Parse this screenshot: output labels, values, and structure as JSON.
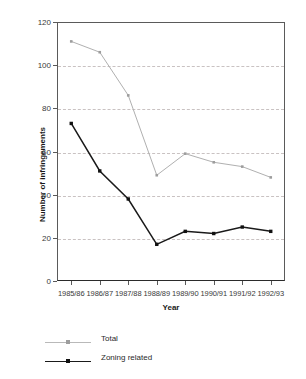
{
  "chart_data": {
    "type": "line",
    "title": "",
    "xlabel": "Year",
    "ylabel": "Number of infringements",
    "categories": [
      "1985/86",
      "1986/87",
      "1987/88",
      "1988/89",
      "1989/90",
      "1990/91",
      "1991/92",
      "1992/93"
    ],
    "series": [
      {
        "name": "Total",
        "color": "#b0b0b0",
        "marker_color": "#9d9d9d",
        "values": [
          111,
          106,
          86,
          49,
          59,
          55,
          53,
          48
        ]
      },
      {
        "name": "Zoning related",
        "color": "#1a1a1a",
        "marker_color": "#111111",
        "values": [
          73,
          51,
          38,
          17,
          23,
          22,
          25,
          23
        ]
      }
    ],
    "ylim": [
      0,
      120
    ],
    "y_ticks": [
      0,
      20,
      40,
      60,
      80,
      100,
      120
    ],
    "y_tick_labels": [
      "0",
      "20",
      "40",
      "60",
      "80",
      "100",
      "120"
    ],
    "grid": true,
    "grid_color": "#c9c2c2",
    "legend_position": "below-left"
  },
  "axes": {
    "y_title": "Number of infringements",
    "x_title": "Year"
  },
  "legend": {
    "items": [
      {
        "label": "Total"
      },
      {
        "label": "Zoning related"
      }
    ]
  }
}
